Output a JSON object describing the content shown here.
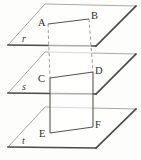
{
  "figure": {
    "type": "geometry-diagram",
    "canvas": {
      "width": 141,
      "height": 160
    },
    "colors": {
      "background": "#fdfdfc",
      "plane_edge_dark": "#4a4a47",
      "plane_edge_light": "#a9a9a6",
      "prism_edge": "#57564f",
      "prism_edge_hidden": "#9d9c97",
      "label_text": "#2e2e2c"
    },
    "planes": [
      {
        "id": "plane-r",
        "label": "r",
        "label_x": 22,
        "label_y": 42,
        "points": "45,4 136,6 96,46 8,45",
        "front_edge": "8,45 96,46",
        "right_edge": "96,46 136,6",
        "back_edge": "45,4 136,6",
        "left_edge": "8,45 45,4"
      },
      {
        "id": "plane-s",
        "label": "s",
        "label_x": 22,
        "label_y": 90,
        "points": "45,52 136,54 96,94 8,93",
        "front_edge": "8,93 96,94",
        "right_edge": "96,94 136,54",
        "back_edge": "45,52 136,54",
        "left_edge": "8,93 45,52"
      },
      {
        "id": "plane-t",
        "label": "t",
        "label_x": 22,
        "label_y": 144,
        "points": "45,107 136,109 96,148 8,147",
        "front_edge": "8,147 96,148",
        "right_edge": "96,148 136,109",
        "back_edge": "45,107 136,109",
        "left_edge": "8,147 45,107"
      }
    ],
    "vertices": [
      {
        "id": "point-a",
        "label": "A",
        "x": 48,
        "y": 24,
        "label_x": 38,
        "label_y": 26
      },
      {
        "id": "point-b",
        "label": "B",
        "x": 89,
        "y": 19,
        "label_x": 91,
        "label_y": 19
      },
      {
        "id": "point-c",
        "label": "C",
        "x": 50,
        "y": 78,
        "label_x": 38,
        "label_y": 82
      },
      {
        "id": "point-d",
        "label": "D",
        "x": 93,
        "y": 72,
        "label_x": 95,
        "label_y": 74
      },
      {
        "id": "point-e",
        "label": "E",
        "x": 50,
        "y": 133,
        "label_x": 39,
        "label_y": 137
      },
      {
        "id": "point-f",
        "label": "F",
        "x": 93,
        "y": 127,
        "label_x": 95,
        "label_y": 128
      }
    ],
    "segments": [
      {
        "id": "segment-ab",
        "from": "A",
        "to": "B",
        "style": "solid",
        "path": "48,24 89,19"
      },
      {
        "id": "segment-cd",
        "from": "C",
        "to": "D",
        "style": "solid",
        "path": "50,78 93,72"
      },
      {
        "id": "segment-ef",
        "from": "E",
        "to": "F",
        "style": "solid",
        "path": "50,133 93,127"
      },
      {
        "id": "segment-ac",
        "from": "A",
        "to": "C",
        "style": "dashed",
        "path": "48,24 50,78"
      },
      {
        "id": "segment-bd",
        "from": "B",
        "to": "D",
        "style": "dashed",
        "path": "89,19 93,72"
      },
      {
        "id": "segment-ce",
        "from": "C",
        "to": "E",
        "style": "solid",
        "path": "50,78 50,133"
      },
      {
        "id": "segment-df",
        "from": "D",
        "to": "F",
        "style": "solid",
        "path": "93,72 93,127"
      }
    ],
    "prism_faces": [
      {
        "id": "prism-face-upper",
        "points": "48,24 89,19 93,72 50,78"
      },
      {
        "id": "prism-face-lower",
        "points": "50,78 93,72 93,127 50,133"
      }
    ]
  }
}
